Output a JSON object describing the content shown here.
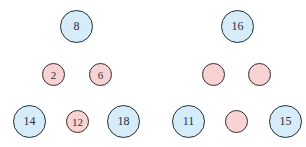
{
  "diagram": {
    "colors": {
      "blue_fill": "#d6ecf8",
      "pink_fill": "#f8d3d4",
      "stroke": "#2b2b33"
    },
    "left": {
      "top": {
        "label": "8",
        "kind": "blue"
      },
      "middle": [
        {
          "label": "2",
          "kind": "pink"
        },
        {
          "label": "6",
          "kind": "pink"
        }
      ],
      "bottom": [
        {
          "label": "14",
          "kind": "blue"
        },
        {
          "label": "12",
          "kind": "pink"
        },
        {
          "label": "18",
          "kind": "blue"
        }
      ]
    },
    "right": {
      "top": {
        "label": "16",
        "kind": "blue"
      },
      "middle": [
        {
          "label": "",
          "kind": "pink"
        },
        {
          "label": "",
          "kind": "pink"
        }
      ],
      "bottom": [
        {
          "label": "11",
          "kind": "blue"
        },
        {
          "label": "",
          "kind": "pink"
        },
        {
          "label": "15",
          "kind": "blue"
        }
      ]
    }
  }
}
